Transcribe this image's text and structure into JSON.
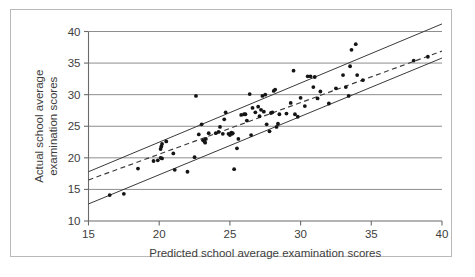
{
  "figure": {
    "border_color": "#b9b9b9",
    "background": "#ffffff"
  },
  "chart_data": {
    "type": "scatter",
    "title": "",
    "xlabel": "Predicted school average examination scores",
    "ylabel": "Actual school average examination scores",
    "xlim": [
      15,
      40
    ],
    "ylim": [
      10,
      40
    ],
    "xticks": [
      15,
      20,
      25,
      30,
      35,
      40
    ],
    "yticks": [
      10,
      15,
      20,
      25,
      30,
      35,
      40
    ],
    "xtick_labels": [
      "15",
      "20",
      "25",
      "30",
      "35",
      "40"
    ],
    "ytick_labels": [
      "10",
      "15",
      "20",
      "25",
      "30",
      "35",
      "40"
    ],
    "grid": "horizontal",
    "legend": "none",
    "marker_color": "#141414",
    "line_color": "#3a3a3a",
    "grid_color": "#8e8e8e",
    "series": [
      {
        "name": "Schools",
        "type": "scatter",
        "points": [
          [
            16.5,
            14.1
          ],
          [
            17.5,
            14.3
          ],
          [
            18.5,
            18.3
          ],
          [
            19.6,
            19.5
          ],
          [
            19.9,
            19.6
          ],
          [
            20.1,
            20.0
          ],
          [
            20.2,
            19.9
          ],
          [
            20.1,
            21.4
          ],
          [
            20.15,
            21.8
          ],
          [
            20.2,
            22.2
          ],
          [
            20.5,
            22.6
          ],
          [
            21.0,
            20.7
          ],
          [
            21.1,
            18.1
          ],
          [
            22.0,
            17.8
          ],
          [
            22.5,
            20.1
          ],
          [
            22.6,
            29.8
          ],
          [
            22.8,
            23.7
          ],
          [
            23.0,
            25.3
          ],
          [
            23.1,
            22.8
          ],
          [
            23.2,
            22.6
          ],
          [
            23.25,
            22.4
          ],
          [
            23.3,
            23.0
          ],
          [
            23.5,
            23.9
          ],
          [
            24.0,
            23.9
          ],
          [
            24.2,
            24.1
          ],
          [
            24.3,
            24.9
          ],
          [
            24.5,
            23.8
          ],
          [
            24.6,
            26.1
          ],
          [
            24.7,
            27.2
          ],
          [
            24.9,
            23.8
          ],
          [
            25.0,
            23.6
          ],
          [
            25.1,
            24.0
          ],
          [
            25.15,
            23.8
          ],
          [
            25.2,
            23.9
          ],
          [
            25.3,
            18.2
          ],
          [
            25.5,
            21.5
          ],
          [
            25.6,
            23.0
          ],
          [
            25.8,
            26.8
          ],
          [
            26.0,
            26.9
          ],
          [
            26.1,
            26.9
          ],
          [
            26.2,
            25.9
          ],
          [
            26.4,
            30.1
          ],
          [
            26.5,
            23.6
          ],
          [
            26.6,
            27.9
          ],
          [
            26.8,
            27.2
          ],
          [
            27.0,
            28.1
          ],
          [
            27.1,
            26.6
          ],
          [
            27.2,
            27.6
          ],
          [
            27.3,
            29.8
          ],
          [
            27.4,
            27.3
          ],
          [
            27.5,
            30.0
          ],
          [
            27.6,
            25.3
          ],
          [
            27.8,
            24.2
          ],
          [
            27.9,
            27.1
          ],
          [
            28.0,
            27.2
          ],
          [
            28.1,
            30.6
          ],
          [
            28.2,
            30.8
          ],
          [
            28.3,
            24.9
          ],
          [
            28.4,
            25.4
          ],
          [
            28.5,
            26.9
          ],
          [
            29.0,
            27.0
          ],
          [
            29.3,
            28.7
          ],
          [
            29.5,
            33.8
          ],
          [
            29.6,
            26.9
          ],
          [
            29.8,
            26.5
          ],
          [
            30.0,
            29.5
          ],
          [
            30.3,
            28.2
          ],
          [
            30.5,
            32.9
          ],
          [
            30.7,
            32.9
          ],
          [
            30.9,
            31.2
          ],
          [
            31.0,
            32.8
          ],
          [
            31.2,
            29.4
          ],
          [
            31.4,
            30.5
          ],
          [
            32.0,
            28.6
          ],
          [
            32.5,
            31.0
          ],
          [
            33.0,
            33.1
          ],
          [
            33.2,
            31.2
          ],
          [
            33.4,
            29.8
          ],
          [
            33.5,
            34.5
          ],
          [
            33.6,
            37.1
          ],
          [
            33.9,
            38.0
          ],
          [
            34.0,
            33.1
          ],
          [
            34.4,
            32.3
          ],
          [
            38.0,
            35.4
          ],
          [
            39.0,
            36.0
          ]
        ]
      },
      {
        "name": "Fitted regression line",
        "type": "line",
        "style": "dashed",
        "x": [
          15,
          40
        ],
        "y": [
          16.5,
          36.9
        ]
      },
      {
        "name": "Upper confidence band",
        "type": "line",
        "style": "solid",
        "x": [
          15,
          40
        ],
        "y": [
          17.8,
          41.2
        ]
      },
      {
        "name": "Lower confidence band",
        "type": "line",
        "style": "solid",
        "x": [
          15,
          40
        ],
        "y": [
          12.7,
          35.8
        ]
      }
    ]
  }
}
